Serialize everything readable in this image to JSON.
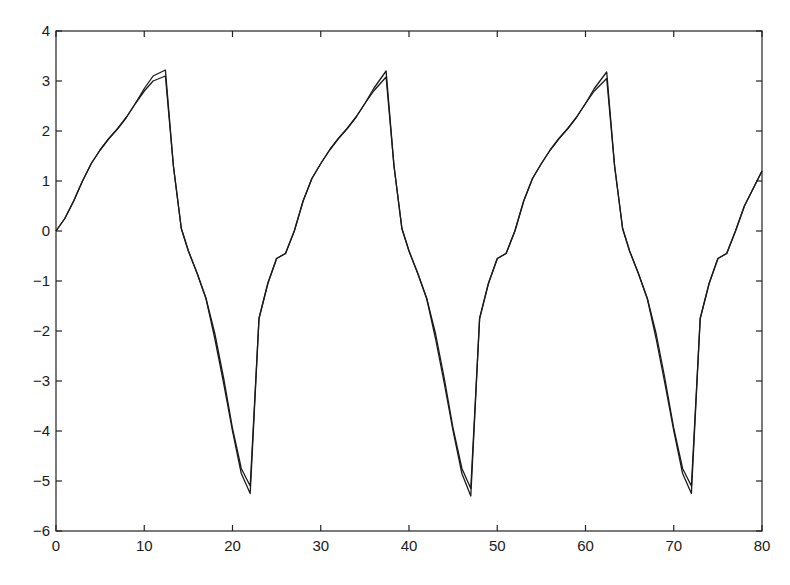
{
  "chart_data": {
    "type": "line",
    "title": "",
    "xlabel": "",
    "ylabel": "",
    "xlim": [
      0,
      80
    ],
    "ylim": [
      -6,
      4
    ],
    "grid": false,
    "legend": null,
    "x_ticks": [
      0,
      10,
      20,
      30,
      40,
      50,
      60,
      70,
      80
    ],
    "y_ticks": [
      4,
      3,
      2,
      1,
      0,
      -1,
      -2,
      -3,
      -4,
      -5,
      -6
    ],
    "x_tick_labels": [
      "0",
      "10",
      "20",
      "30",
      "40",
      "50",
      "60",
      "70",
      "80"
    ],
    "y_tick_labels": [
      "4",
      "3",
      "2",
      "1",
      "0",
      "−1",
      "−2",
      "−3",
      "−4",
      "−5",
      "−6"
    ],
    "series": [
      {
        "name": "series-1",
        "color": "#1a1a1a",
        "x": [
          0,
          1,
          2,
          3,
          4,
          5,
          6,
          7,
          8,
          9,
          10,
          11,
          12.4,
          13.3,
          14.2,
          15,
          16,
          17,
          18,
          19,
          20,
          21,
          22,
          23,
          24,
          25,
          26,
          27,
          28,
          29,
          30,
          31,
          32,
          33,
          34,
          35,
          36,
          37.4,
          38.3,
          39.2,
          40,
          41,
          42,
          43,
          44,
          45,
          46,
          47,
          48,
          49,
          50,
          51,
          52,
          53,
          54,
          55,
          56,
          57,
          58,
          59,
          60,
          61,
          62.4,
          63.3,
          64.2,
          65,
          66,
          67,
          68,
          69,
          70,
          71,
          72,
          73,
          74,
          75,
          76,
          77,
          78,
          79,
          80
        ],
        "values": [
          0,
          0.25,
          0.6,
          1.0,
          1.35,
          1.62,
          1.85,
          2.05,
          2.28,
          2.55,
          2.85,
          3.1,
          3.22,
          1.3,
          0.05,
          -0.4,
          -0.85,
          -1.35,
          -2.15,
          -3.05,
          -4.0,
          -4.85,
          -5.25,
          -1.75,
          -1.05,
          -0.55,
          -0.45,
          0.0,
          0.6,
          1.05,
          1.35,
          1.62,
          1.85,
          2.05,
          2.28,
          2.55,
          2.85,
          3.2,
          1.3,
          0.05,
          -0.4,
          -0.85,
          -1.35,
          -2.15,
          -3.05,
          -4.0,
          -4.85,
          -5.3,
          -1.75,
          -1.05,
          -0.55,
          -0.45,
          0.0,
          0.6,
          1.05,
          1.35,
          1.62,
          1.85,
          2.05,
          2.28,
          2.55,
          2.85,
          3.18,
          1.3,
          0.05,
          -0.4,
          -0.85,
          -1.35,
          -2.15,
          -3.05,
          -4.0,
          -4.85,
          -5.25,
          -1.75,
          -1.05,
          -0.55,
          -0.45,
          0.0,
          0.5,
          0.85,
          1.2
        ]
      },
      {
        "name": "series-2",
        "color": "#1a1a1a",
        "x": [
          0,
          1,
          2,
          3,
          4,
          5,
          6,
          7,
          8,
          9,
          10,
          11,
          12.4,
          13.3,
          14.2,
          15,
          16,
          17,
          18,
          19,
          20,
          21,
          22,
          23,
          24,
          25,
          26,
          27,
          28,
          29,
          30,
          31,
          32,
          33,
          34,
          35,
          36,
          37.4,
          38.3,
          39.2,
          40,
          41,
          42,
          43,
          44,
          45,
          46,
          47,
          48,
          49,
          50,
          51,
          52,
          53,
          54,
          55,
          56,
          57,
          58,
          59,
          60,
          61,
          62.4,
          63.3,
          64.2,
          65,
          66,
          67,
          68,
          69,
          70,
          71,
          72,
          73,
          74,
          75,
          76,
          77,
          78,
          79,
          80
        ],
        "values": [
          0,
          0.25,
          0.6,
          1.0,
          1.35,
          1.62,
          1.85,
          2.05,
          2.28,
          2.55,
          2.8,
          3.0,
          3.1,
          1.3,
          0.05,
          -0.4,
          -0.85,
          -1.35,
          -2.05,
          -2.95,
          -3.95,
          -4.75,
          -5.1,
          -1.75,
          -1.05,
          -0.55,
          -0.45,
          0.0,
          0.6,
          1.05,
          1.35,
          1.62,
          1.85,
          2.05,
          2.28,
          2.55,
          2.8,
          3.08,
          1.3,
          0.05,
          -0.4,
          -0.85,
          -1.35,
          -2.05,
          -2.95,
          -3.95,
          -4.75,
          -5.15,
          -1.75,
          -1.05,
          -0.55,
          -0.45,
          0.0,
          0.6,
          1.05,
          1.35,
          1.62,
          1.85,
          2.05,
          2.28,
          2.55,
          2.8,
          3.05,
          1.3,
          0.05,
          -0.4,
          -0.85,
          -1.35,
          -2.05,
          -2.95,
          -3.95,
          -4.75,
          -5.1,
          -1.75,
          -1.05,
          -0.55,
          -0.45,
          0.0,
          0.5,
          0.85,
          1.2
        ]
      }
    ]
  },
  "layout": {
    "plot_left": 56,
    "plot_right": 762,
    "plot_top": 31,
    "plot_bottom": 531
  }
}
